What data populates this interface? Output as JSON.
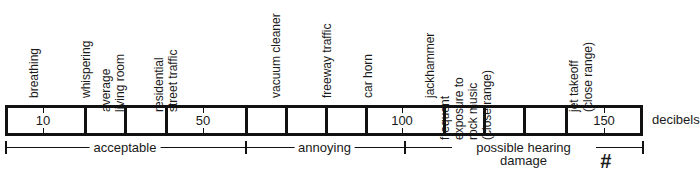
{
  "sources": [
    {
      "lines": [
        "breathing"
      ],
      "x": 34
    },
    {
      "lines": [
        "whispering"
      ],
      "x": 86
    },
    {
      "lines": [
        "average",
        "living room"
      ],
      "x": 127
    },
    {
      "lines": [
        "residential",
        "street traffic"
      ],
      "x": 180
    },
    {
      "lines": [
        "vacuum cleaner"
      ],
      "x": 276
    },
    {
      "lines": [
        "freeway traffic"
      ],
      "x": 327
    },
    {
      "lines": [
        "car horn"
      ],
      "x": 368
    },
    {
      "lines": [
        "jackhammer"
      ],
      "x": 430
    },
    {
      "lines": [
        "frequent",
        "exposure to",
        "rock music",
        "(close range)"
      ],
      "x": 508
    },
    {
      "lines": [
        "jet takeoff",
        "(close range)"
      ],
      "x": 595
    }
  ],
  "scale": {
    "unit_label": "decibels",
    "numbers": [
      {
        "label": "10",
        "x": 43
      },
      {
        "label": "50",
        "x": 203
      },
      {
        "label": "100",
        "x": 402
      },
      {
        "label": "150",
        "x": 604
      }
    ],
    "dividers": [
      84,
      124,
      165,
      245,
      285,
      325,
      365,
      443,
      483,
      523,
      565
    ]
  },
  "zones": [
    {
      "label": "acceptable",
      "start": 5,
      "end": 245
    },
    {
      "label": "annoying",
      "start": 245,
      "end": 404
    },
    {
      "label": "possible hearing damage",
      "line1": "possible hearing",
      "line2": "damage",
      "start": 404,
      "end": 643
    }
  ],
  "annotation": {
    "mark": "#"
  }
}
